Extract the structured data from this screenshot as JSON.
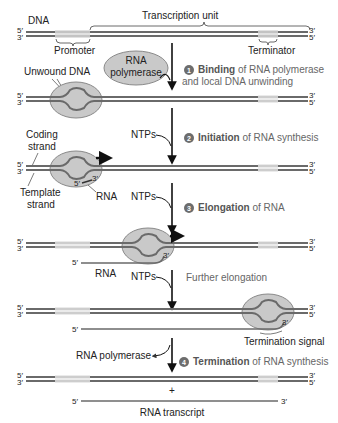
{
  "labels": {
    "dna": "DNA",
    "transcription_unit": "Transcription unit",
    "promoter": "Promoter",
    "terminator": "Terminator",
    "rna_polymerase_line1": "RNA",
    "rna_polymerase_line2": "polymerase",
    "unwound_dna": "Unwound DNA",
    "coding_strand_line1": "Coding",
    "coding_strand_line2": "strand",
    "template_strand_line1": "Template",
    "template_strand_line2": "strand",
    "rna": "RNA",
    "ntps": "NTPs",
    "further_elongation": "Further elongation",
    "termination_signal": "Termination signal",
    "rna_polymerase_release": "RNA polymerase",
    "plus": "+",
    "rna_transcript": "RNA transcript",
    "five_prime": "5′",
    "three_prime": "3′"
  },
  "steps": [
    {
      "number": "1",
      "bold": "Binding",
      "rest": " of RNA polymerase",
      "line2": "and local DNA unwinding"
    },
    {
      "number": "2",
      "bold": "Initiation",
      "rest": " of RNA synthesis"
    },
    {
      "number": "3",
      "bold": "Elongation",
      "rest": " of RNA"
    },
    {
      "number": "4",
      "bold": "Termination",
      "rest": " of RNA synthesis"
    }
  ],
  "colors": {
    "strand": "#6a6a6a",
    "strand_light": "#c8c8c8",
    "polymerase_fill": "#c9c9c9",
    "polymerase_stroke": "#8a8a8a",
    "step_badge": "#6d6d6d"
  }
}
